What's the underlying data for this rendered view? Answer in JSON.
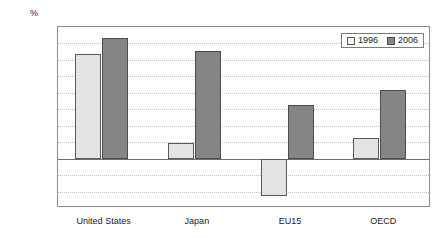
{
  "chart_data": {
    "type": "bar",
    "title": "",
    "xlabel": "",
    "ylabel": "%",
    "ylim": [
      -0.15,
      0.4
    ],
    "ytick_step": 0.05,
    "grid": true,
    "legend_position": "top-right",
    "categories": [
      "United States",
      "Japan",
      "EU15",
      "OECD"
    ],
    "ytick_labels": [
      "0.40",
      "0.35",
      "0.30",
      "0.25",
      "0.20",
      "0.15",
      "0.10",
      "0.05",
      "0.00",
      "-0.05",
      "-0.10",
      "-0.15"
    ],
    "ytick_values": [
      0.4,
      0.35,
      0.3,
      0.25,
      0.2,
      0.15,
      0.1,
      0.05,
      0.0,
      -0.05,
      -0.1,
      -0.15
    ],
    "series": [
      {
        "name": "1996",
        "color": "#e3e3e3",
        "values": [
          0.317,
          0.049,
          -0.115,
          0.064
        ]
      },
      {
        "name": "2006",
        "color": "#858585",
        "values": [
          0.368,
          0.326,
          0.162,
          0.209
        ]
      }
    ]
  },
  "legend": {
    "items": [
      {
        "label": "1996"
      },
      {
        "label": "2006"
      }
    ]
  }
}
